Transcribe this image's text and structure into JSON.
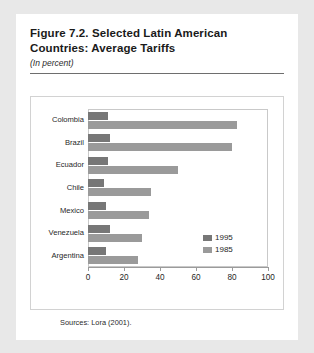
{
  "figure": {
    "title_line1": "Figure 7.2.  Selected Latin American",
    "title_line2": "Countries: Average Tariffs",
    "subtitle": "(In percent)",
    "source_note": "Sources: Lora (2001)."
  },
  "chart_data": {
    "type": "bar",
    "orientation": "horizontal",
    "title": "Figure 7.2. Selected Latin American Countries: Average Tariffs",
    "subtitle": "(In percent)",
    "xlabel": "",
    "ylabel": "",
    "xlim": [
      0,
      100
    ],
    "xticks": [
      0,
      20,
      40,
      60,
      80,
      100
    ],
    "grid": false,
    "legend_position": "inside-right",
    "categories": [
      "Colombia",
      "Brazil",
      "Ecuador",
      "Chile",
      "Mexico",
      "Venezuela",
      "Argentina"
    ],
    "series": [
      {
        "name": "1995",
        "color": "#777777",
        "values": [
          11,
          12,
          11,
          9,
          10,
          12,
          10
        ]
      },
      {
        "name": "1985",
        "color": "#9a9a9a",
        "values": [
          83,
          80,
          50,
          35,
          34,
          30,
          28
        ]
      }
    ]
  }
}
